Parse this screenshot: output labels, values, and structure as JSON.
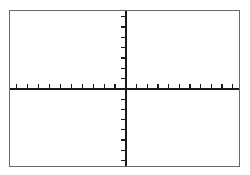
{
  "figure": {
    "kind": "blank-coordinate-plane",
    "background_color": "#ffffff",
    "frame": {
      "border_color": "#6b6b6b",
      "border_width_px": 1,
      "left_px": 9,
      "top_px": 10,
      "width_px": 231,
      "height_px": 157
    },
    "axis_color": "#1a1a1a",
    "tick_color": "#1a1a1a"
  },
  "chart_data": {
    "type": "line",
    "title": "",
    "subtitle": "",
    "xlabel": "",
    "ylabel": "",
    "series": [],
    "annotations": [],
    "legend": {
      "visible": false,
      "position": "none",
      "entries": []
    },
    "grid": {
      "visible": false,
      "major": false,
      "minor": false
    },
    "axes": {
      "origin_px": {
        "x": 116,
        "y": 78
      },
      "x_axis": {
        "visible": true,
        "range": [
          -10,
          10
        ],
        "tick_interval": 1,
        "tick_count_left_of_origin": 10,
        "tick_count_right_of_origin": 10,
        "tick_length_px": 5,
        "tick_direction": "up",
        "tick_labels": [],
        "labels_visible": false
      },
      "y_axis": {
        "visible": true,
        "range": [
          -7,
          7
        ],
        "tick_interval": 1,
        "tick_count_above_origin": 7,
        "tick_count_below_origin": 7,
        "tick_length_px": 5,
        "tick_direction": "left",
        "tick_labels": [],
        "labels_visible": false
      }
    }
  }
}
